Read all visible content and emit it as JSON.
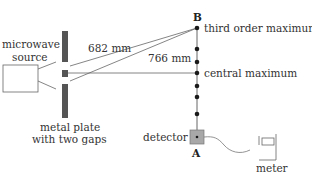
{
  "diagram": {
    "type": "double-slit microwave interference setup",
    "labels": {
      "source_line1": "microwave",
      "source_line2": "source",
      "plate_line1": "metal plate",
      "plate_line2": "with two gaps",
      "distance_upper": "682 mm",
      "distance_lower": "766 mm",
      "point_b": "B",
      "point_a": "A",
      "third_order": "third order maximum",
      "central": "central maximum",
      "detector": "detector",
      "meter": "meter"
    },
    "colors": {
      "line": "#555555",
      "plate": "#555555",
      "detector_fill": "#a8a8a8",
      "dot": "#1a1a1a",
      "text": "#333333"
    },
    "track_dots_y": [
      28,
      49,
      62,
      73,
      86,
      97,
      114,
      132
    ]
  }
}
